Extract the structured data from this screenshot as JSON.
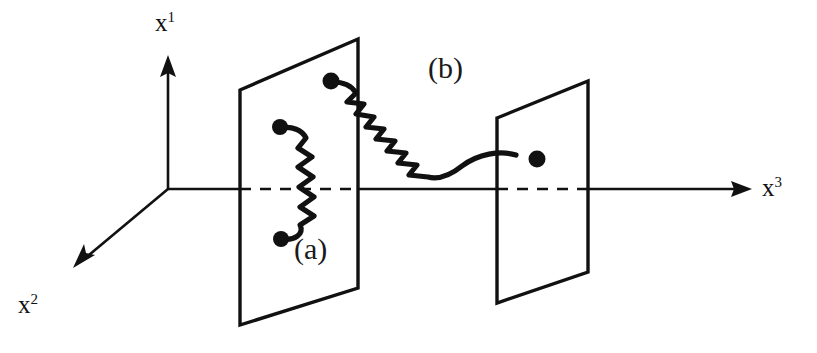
{
  "figure": {
    "background_color": "#ffffff",
    "ink_color": "#111111"
  },
  "axes": {
    "origin": {
      "x": 168,
      "y": 189
    },
    "items": [
      {
        "id": "x1",
        "label": "x",
        "superscript": "1",
        "name": "vertical-axis",
        "direction": "up",
        "arrow_tip": {
          "x": 168,
          "y": 55
        }
      },
      {
        "id": "x2",
        "label": "x",
        "superscript": "2",
        "name": "depth-axis",
        "direction": "down-left",
        "arrow_tip": {
          "x": 73,
          "y": 268
        }
      },
      {
        "id": "x3",
        "label": "x",
        "superscript": "3",
        "name": "horizontal-axis",
        "direction": "right",
        "arrow_tip": {
          "x": 752,
          "y": 189
        }
      }
    ]
  },
  "planes": [
    {
      "id": "plane-1",
      "name": "left-hyperplane",
      "corners": [
        {
          "x": 240,
          "y": 90
        },
        {
          "x": 358,
          "y": 39
        },
        {
          "x": 358,
          "y": 288
        },
        {
          "x": 240,
          "y": 325
        }
      ]
    },
    {
      "id": "plane-2",
      "name": "right-hyperplane",
      "corners": [
        {
          "x": 497,
          "y": 118
        },
        {
          "x": 588,
          "y": 81
        },
        {
          "x": 588,
          "y": 272
        },
        {
          "x": 497,
          "y": 303
        }
      ]
    }
  ],
  "interactions": [
    {
      "id": "a",
      "label": "(a)",
      "name": "interaction-a",
      "description": "vertical wavy line inside left hyperplane",
      "endpoints": [
        {
          "x": 280,
          "y": 127
        },
        {
          "x": 281,
          "y": 239
        }
      ],
      "label_position": {
        "x": 294,
        "y": 234
      }
    },
    {
      "id": "b",
      "label": "(b)",
      "name": "interaction-b",
      "description": "diagonal wavy line connecting the two hyperplanes",
      "endpoints": [
        {
          "x": 331,
          "y": 81
        },
        {
          "x": 537,
          "y": 159
        }
      ],
      "label_position": {
        "x": 428,
        "y": 53
      }
    }
  ],
  "dashed_axis_segments": [
    {
      "from_x": 240,
      "to_x": 358,
      "y": 189,
      "name": "dashed-through-plane-1"
    },
    {
      "from_x": 497,
      "to_x": 588,
      "y": 189,
      "name": "dashed-through-plane-2"
    }
  ]
}
